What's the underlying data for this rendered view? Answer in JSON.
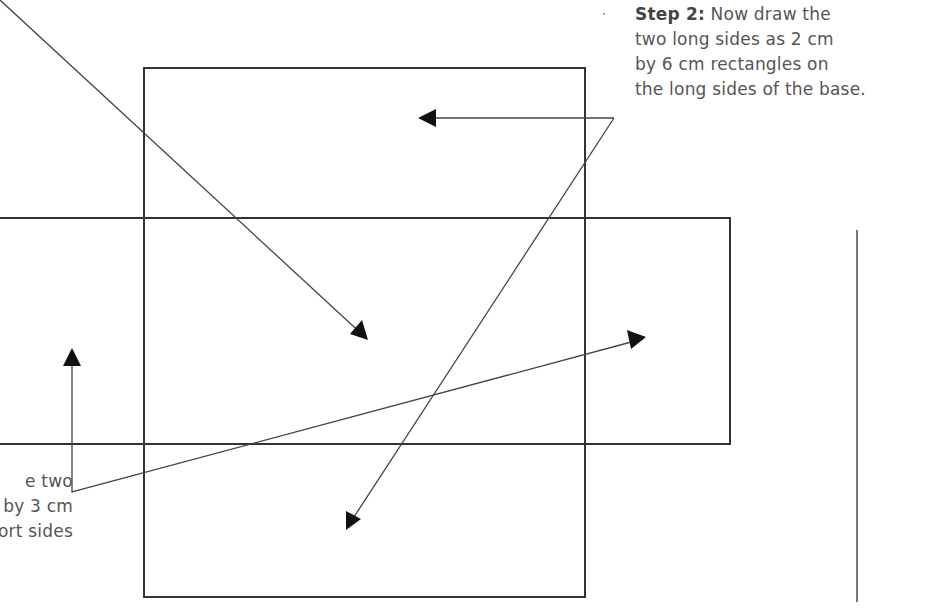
{
  "step2": {
    "heading": "Step 2:",
    "lines": [
      " Now draw the",
      "two long sides as 2 cm",
      "by 6 cm rectangles on",
      "the long sides of the base."
    ]
  },
  "step1_partial": {
    "lines": [
      "e two",
      "by 3 cm",
      "ort sides"
    ]
  },
  "shapes": {
    "base_rect": {
      "x": 144,
      "y": 68,
      "w": 441,
      "h": 529
    },
    "side_rect": {
      "x": 0,
      "y": 218,
      "w": 730,
      "h": 226
    },
    "right_margin_line": {
      "x": 857,
      "y1": 230,
      "y2": 600
    }
  },
  "colors": {
    "stroke": "#333333",
    "text": "#555555"
  }
}
